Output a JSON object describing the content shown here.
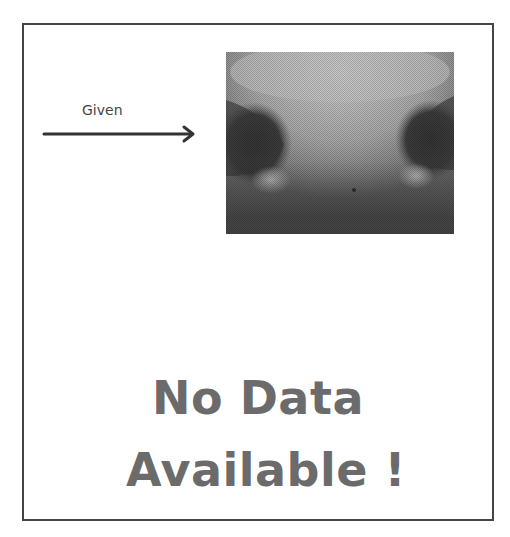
{
  "figure": {
    "given_label": "Given",
    "arrow": {
      "direction": "right",
      "color": "#333333"
    },
    "image": {
      "subject": "grayscale close-up of animal muzzle (nose)",
      "alt": "Given muzzle image"
    },
    "message": {
      "line1": "No Data",
      "line2": "Available !",
      "color": "#6b6b6b"
    },
    "border_color": "#444444"
  }
}
